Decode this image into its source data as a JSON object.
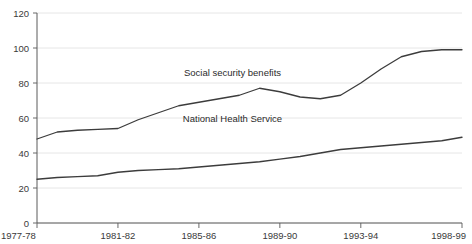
{
  "chart_data": {
    "type": "line",
    "title": "",
    "xlabel": "",
    "ylabel": "",
    "ylim": [
      0,
      120
    ],
    "yticks": [
      0,
      20,
      40,
      60,
      80,
      100,
      120
    ],
    "grid": true,
    "legend_position": "inline-annotation",
    "categories": [
      "1977-78",
      "1978-79",
      "1979-80",
      "1980-81",
      "1981-82",
      "1982-83",
      "1983-84",
      "1984-85",
      "1985-86",
      "1986-87",
      "1987-88",
      "1988-89",
      "1989-90",
      "1990-91",
      "1991-92",
      "1992-93",
      "1993-94",
      "1994-95",
      "1995-96",
      "1996-97",
      "1997-98",
      "1998-99"
    ],
    "xticks": [
      "1977-78",
      "1981-82",
      "1985-86",
      "1989-90",
      "1993-94",
      "1998-99"
    ],
    "series": [
      {
        "name": "Social security benefits",
        "values": [
          48,
          52,
          53,
          53.5,
          54,
          59,
          63,
          67,
          69,
          71,
          73,
          77,
          75,
          72,
          71,
          73,
          80,
          88,
          95,
          98,
          99,
          99
        ]
      },
      {
        "name": "National Health Service",
        "values": [
          25,
          26,
          26.5,
          27,
          29,
          30,
          30.5,
          31,
          32,
          33,
          34,
          35,
          36.5,
          38,
          40,
          42,
          43,
          44,
          45,
          46,
          47,
          49
        ]
      }
    ],
    "annotations": [
      {
        "text": "Social security benefits",
        "x_pct": 46,
        "y_value": 84
      },
      {
        "text": "National Health Service",
        "x_pct": 46,
        "y_value": 58
      }
    ]
  },
  "axis": {
    "y_tick_labels": [
      "120",
      "100",
      "80",
      "60",
      "40",
      "20",
      "0"
    ],
    "x_tick_labels": [
      "1977-78",
      "1981-82",
      "1985-86",
      "1989-90",
      "1993-94",
      "1998-99"
    ]
  },
  "colors": {
    "line": "#3c3c3c",
    "grid": "#e6e6e6",
    "axis": "#5a5a5a",
    "text": "#3a3a3a",
    "background": "#ffffff"
  }
}
